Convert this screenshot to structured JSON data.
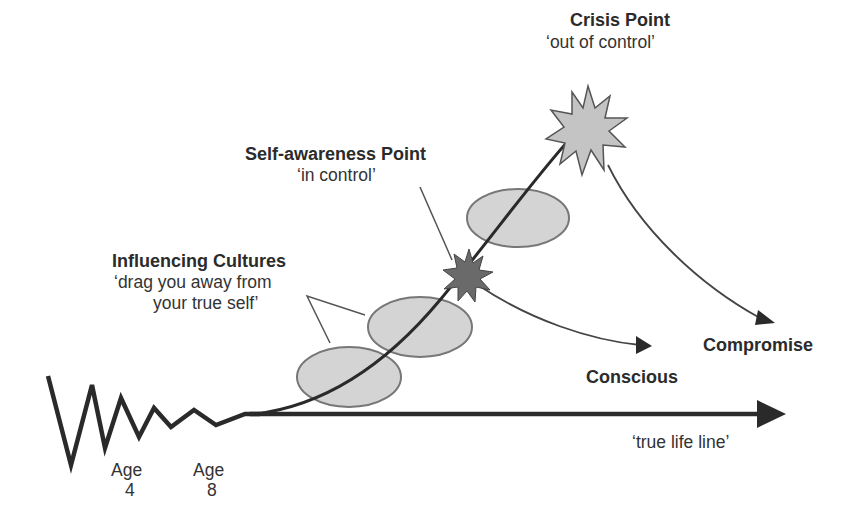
{
  "diagram": {
    "labels": {
      "crisis_title": "Crisis Point",
      "crisis_sub": "‘out of control’",
      "self_title": "Self-awareness Point",
      "self_sub": "‘in control’",
      "influence_title": "Influencing Cultures",
      "influence_sub1": "‘drag you away from",
      "influence_sub2": "your true self’",
      "conscious": "Conscious",
      "compromise": "Compromise",
      "true_life_line": "‘true life line’",
      "age4_word": "Age",
      "age4_num": "4",
      "age8_word": "Age",
      "age8_num": "8"
    },
    "colors": {
      "line": "#2a2a2a",
      "ellipse_fill": "#d4d4d4",
      "ellipse_stroke": "#777777",
      "crisis_star_fill": "#c4c4c4",
      "self_star_fill": "#6a6a6a"
    }
  }
}
